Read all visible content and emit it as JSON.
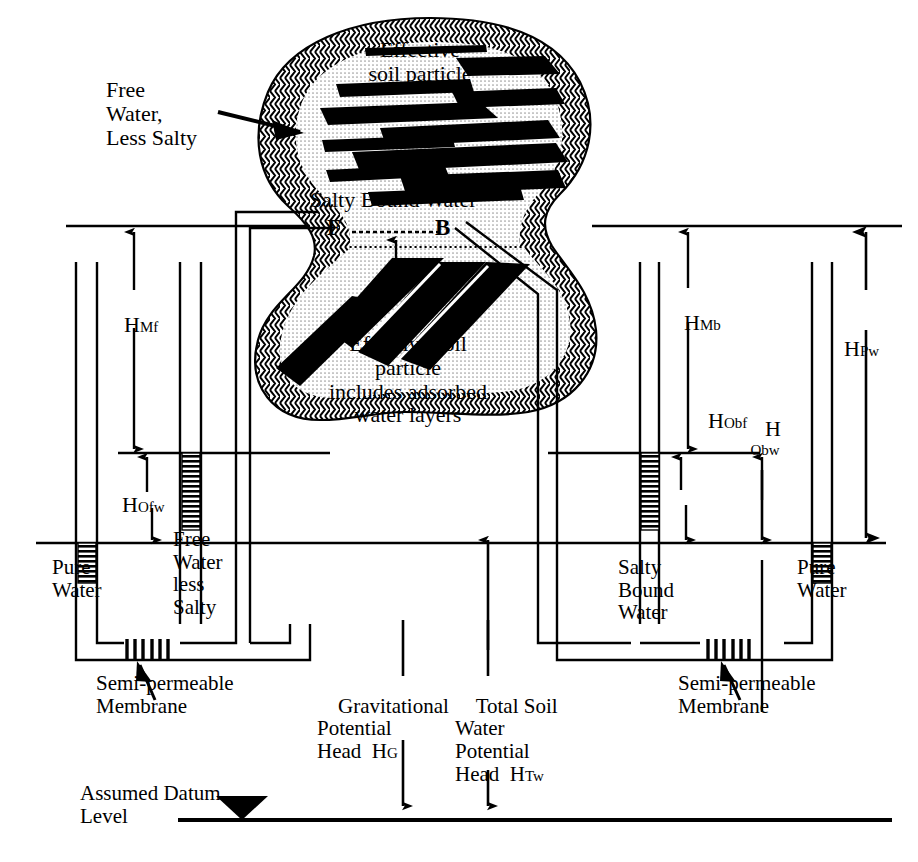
{
  "diagram": {
    "colors": {
      "ink": "#000000",
      "background": "#ffffff",
      "bound_water_fill": "#d8d8d8",
      "free_water_fill": "#ffffff"
    }
  },
  "particle": {
    "free_water_label": "Free\nWater,\nLess Salty",
    "effective_particle_top": "Effective\nsoil particle",
    "salty_bound_water": "Salty Bound Water",
    "effective_particle_bottom": "Effective soil\nparticle\nincludes adsorbed\nwater layers",
    "point_f": "F",
    "point_b": "B"
  },
  "heads": {
    "h_mf": {
      "symbol": "H",
      "subscript": "Mf"
    },
    "h_ofw": {
      "symbol": "H",
      "subscript": "Ofw"
    },
    "h_mb": {
      "symbol": "H",
      "subscript": "Mb"
    },
    "h_obf": {
      "symbol": "H",
      "subscript": "Obf"
    },
    "h_obw": {
      "symbol": "H",
      "subscript": "Obw"
    },
    "h_pw": {
      "symbol": "H",
      "subscript": "Pw"
    },
    "h_g": {
      "symbol": "H",
      "subscript": "G"
    },
    "h_tw": {
      "symbol": "H",
      "subscript": "Tw"
    }
  },
  "left_assembly": {
    "pure_water": "Pure\nWater",
    "free_water_less_salty": "Free\nWater\nless\nSalty",
    "membrane": "Semi-permeable\nMembrane"
  },
  "right_assembly": {
    "salty_bound_water": "Salty\nBound\nWater",
    "pure_water": "Pure\nWater",
    "membrane": "Semi-permeable\nMembrane"
  },
  "potentials": {
    "gravitational": "Gravitational\nPotential\nHead  H",
    "gravitational_sub": "G",
    "total_soil_water": "Total Soil\nWater\nPotential\nHead  H",
    "total_soil_water_sub": "Tw"
  },
  "datum": {
    "label": "Assumed Datum\nLevel"
  }
}
